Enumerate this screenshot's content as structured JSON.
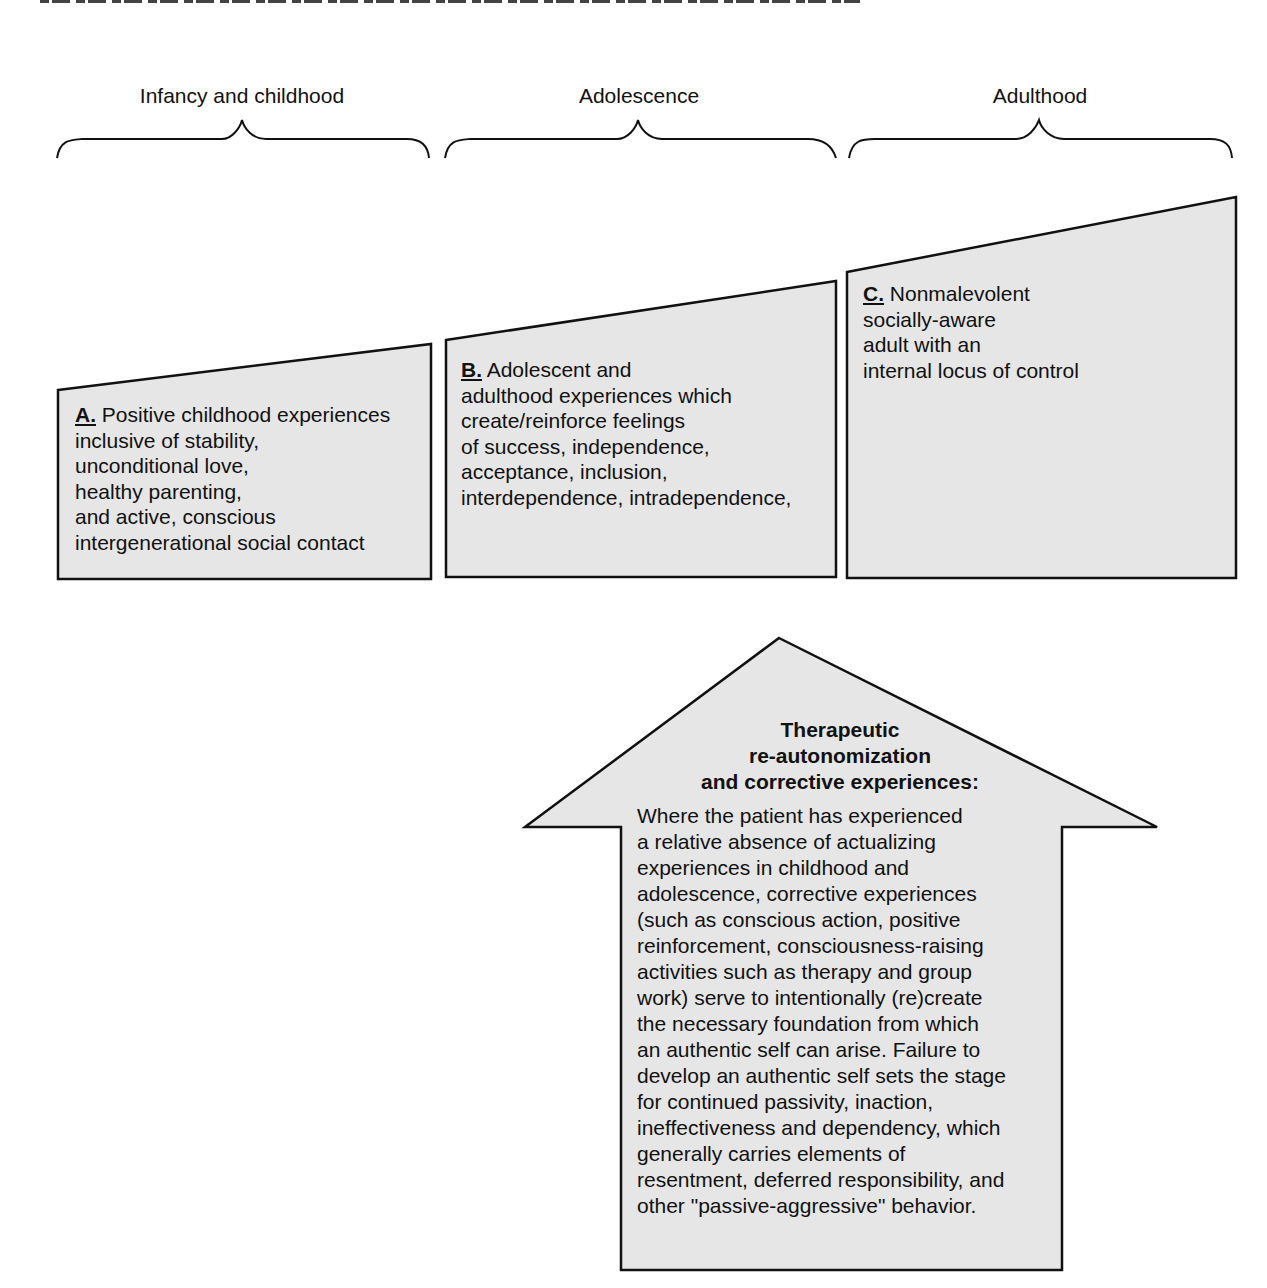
{
  "figure": {
    "top_line_note": "",
    "stages": [
      {
        "label": "Infancy and childhood"
      },
      {
        "label": "Adolescence"
      },
      {
        "label": "Adulthood"
      }
    ],
    "boxes": [
      {
        "key": "A.",
        "lines": [
          "Positive childhood experiences",
          "inclusive of stability,",
          "unconditional love,",
          "healthy parenting,",
          "and active, conscious",
          "intergenerational social contact"
        ]
      },
      {
        "key": "B.",
        "lines": [
          "Adolescent and",
          "adulthood experiences which",
          "create/reinforce feelings",
          "of success, independence,",
          "acceptance, inclusion,",
          "interdependence, intradependence,"
        ]
      },
      {
        "key": "C.",
        "lines": [
          "Nonmalevolent",
          "socially-aware",
          "adult with an",
          "internal locus of control"
        ]
      }
    ],
    "arrow": {
      "title_lines": [
        "Therapeutic",
        "re-autonomization",
        "and corrective experiences:"
      ],
      "body_lines": [
        "Where the patient has experienced",
        "a relative absence of actualizing",
        "experiences in childhood and",
        "adolescence, corrective experiences",
        "(such as conscious action, positive",
        "reinforcement, consciousness-raising",
        "activities such as therapy and group",
        "work) serve to intentionally (re)create",
        "the necessary foundation from which",
        "an authentic self can arise. Failure to",
        "develop an authentic self sets the stage",
        "for continued passivity, inaction,",
        "ineffectiveness and dependency, which",
        "generally carries elements of",
        "resentment, deferred responsibility, and",
        "other \"passive-aggressive\" behavior."
      ]
    },
    "colors": {
      "fill": "#e6e6e6",
      "stroke": "#111111",
      "background": "#ffffff"
    }
  }
}
